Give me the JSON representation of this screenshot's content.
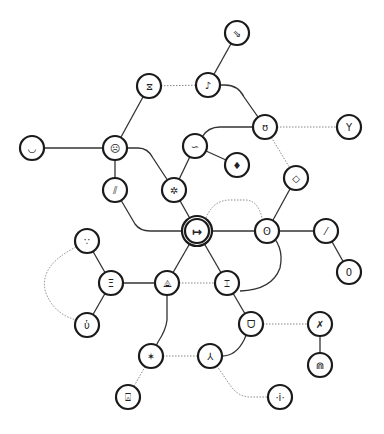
{
  "diagram": {
    "type": "node-graph",
    "background": "#ffffff",
    "node_stroke": "#1a1a1a",
    "edge_color": "#333333",
    "dotted_edge_color": "#888888",
    "node_radius": 12,
    "nodes": [
      {
        "id": "n1",
        "x": 237,
        "y": 33,
        "glyph": "⇘",
        "icon": "diagonal-arrows-icon"
      },
      {
        "id": "n2",
        "x": 208,
        "y": 85,
        "glyph": "♪",
        "icon": "curl-icon"
      },
      {
        "id": "n3",
        "x": 149,
        "y": 86,
        "glyph": "⧖",
        "icon": "hourglass-icon"
      },
      {
        "id": "n4",
        "x": 265,
        "y": 127,
        "glyph": "ʊ",
        "icon": "cup-icon"
      },
      {
        "id": "n5",
        "x": 349,
        "y": 127,
        "glyph": "Y",
        "icon": "fork-icon"
      },
      {
        "id": "n6",
        "x": 195,
        "y": 146,
        "glyph": "∽",
        "icon": "wave-icon"
      },
      {
        "id": "n7",
        "x": 237,
        "y": 165,
        "glyph": "♦",
        "icon": "gem-icon"
      },
      {
        "id": "n8",
        "x": 115,
        "y": 148,
        "glyph": "☹",
        "icon": "frown-face-icon"
      },
      {
        "id": "n9",
        "x": 32,
        "y": 148,
        "glyph": "◡",
        "icon": "smile-icon"
      },
      {
        "id": "n10",
        "x": 115,
        "y": 190,
        "glyph": "⫽",
        "icon": "double-slash-icon"
      },
      {
        "id": "n11",
        "x": 174,
        "y": 190,
        "glyph": "✲",
        "icon": "sparkle-icon"
      },
      {
        "id": "n12",
        "x": 296,
        "y": 178,
        "glyph": "◇",
        "icon": "diamond-icon"
      },
      {
        "id": "n13",
        "x": 197,
        "y": 231,
        "glyph": "↦",
        "icon": "maps-to-icon",
        "center": true
      },
      {
        "id": "n14",
        "x": 267,
        "y": 231,
        "glyph": "ʘ",
        "icon": "target-icon"
      },
      {
        "id": "n15",
        "x": 326,
        "y": 231,
        "glyph": "⁄",
        "icon": "slash-icon"
      },
      {
        "id": "n16",
        "x": 349,
        "y": 272,
        "glyph": "0",
        "icon": "capsule-icon"
      },
      {
        "id": "n17",
        "x": 87,
        "y": 241,
        "glyph": "∵",
        "icon": "dots-icon"
      },
      {
        "id": "n18",
        "x": 111,
        "y": 283,
        "glyph": "Ξ",
        "icon": "xi-icon"
      },
      {
        "id": "n19",
        "x": 167,
        "y": 283,
        "glyph": "⟁",
        "icon": "triangle-node-icon"
      },
      {
        "id": "n20",
        "x": 227,
        "y": 283,
        "glyph": "⌶",
        "icon": "beam-icon"
      },
      {
        "id": "n21",
        "x": 87,
        "y": 325,
        "glyph": "ὑ",
        "icon": "u-dot-icon"
      },
      {
        "id": "n22",
        "x": 251,
        "y": 324,
        "glyph": "ᗜ",
        "icon": "bowl-icon"
      },
      {
        "id": "n23",
        "x": 320,
        "y": 324,
        "glyph": "✗",
        "icon": "cross-icon"
      },
      {
        "id": "n24",
        "x": 151,
        "y": 356,
        "glyph": "✶",
        "icon": "star-icon"
      },
      {
        "id": "n25",
        "x": 210,
        "y": 356,
        "glyph": "⅄",
        "icon": "turned-y-icon"
      },
      {
        "id": "n26",
        "x": 320,
        "y": 365,
        "glyph": "⋒",
        "icon": "arch-icon"
      },
      {
        "id": "n27",
        "x": 128,
        "y": 397,
        "glyph": "⍓",
        "icon": "lamp-icon"
      },
      {
        "id": "n28",
        "x": 280,
        "y": 397,
        "glyph": "·i·",
        "icon": "info-dots-icon"
      }
    ],
    "edges": [
      {
        "d": "M237,33 L208,85",
        "style": "solid"
      },
      {
        "d": "M149,86 L208,85",
        "style": "dotted"
      },
      {
        "d": "M208,85 L225,85 Q238,85 244,97 L265,127",
        "style": "solid"
      },
      {
        "d": "M265,127 L349,127",
        "style": "dotted"
      },
      {
        "d": "M149,86 L115,148",
        "style": "solid"
      },
      {
        "d": "M32,148 L115,148",
        "style": "solid"
      },
      {
        "d": "M115,148 L115,190",
        "style": "solid"
      },
      {
        "d": "M115,148 L138,148 Q148,148 153,158 L174,190",
        "style": "solid"
      },
      {
        "d": "M265,127 L220,127 Q208,127 202,137 L195,146",
        "style": "solid"
      },
      {
        "d": "M195,146 L237,165",
        "style": "solid"
      },
      {
        "d": "M195,146 L174,190",
        "style": "solid"
      },
      {
        "d": "M174,190 L197,231",
        "style": "solid"
      },
      {
        "d": "M265,127 L296,178",
        "style": "dotted"
      },
      {
        "d": "M296,178 L267,231",
        "style": "solid"
      },
      {
        "d": "M115,190 L135,224 Q140,231 150,231 L197,231",
        "style": "solid"
      },
      {
        "d": "M197,231 L267,231",
        "style": "solid"
      },
      {
        "d": "M206,218 Q213,200 230,200 L245,200 Q258,200 262,218",
        "style": "dotted"
      },
      {
        "d": "M267,231 L326,231",
        "style": "solid"
      },
      {
        "d": "M326,231 L349,272",
        "style": "solid"
      },
      {
        "d": "M267,231 Q285,245 280,268 Q272,290 240,291",
        "style": "solid"
      },
      {
        "d": "M197,231 L167,283",
        "style": "solid"
      },
      {
        "d": "M197,231 L227,283",
        "style": "solid"
      },
      {
        "d": "M111,283 L167,283",
        "style": "solid"
      },
      {
        "d": "M167,283 L227,283",
        "style": "dotted"
      },
      {
        "d": "M111,283 L87,241",
        "style": "solid"
      },
      {
        "d": "M111,283 L87,325",
        "style": "solid"
      },
      {
        "d": "M76,247 Q40,265 45,290 Q52,313 76,320",
        "style": "dotted"
      },
      {
        "d": "M227,283 L251,324",
        "style": "solid"
      },
      {
        "d": "M251,324 L320,324",
        "style": "dotted"
      },
      {
        "d": "M320,324 L320,365",
        "style": "solid"
      },
      {
        "d": "M167,283 L167,320 Q166,330 158,342 L151,356",
        "style": "solid"
      },
      {
        "d": "M151,356 L210,356",
        "style": "dotted"
      },
      {
        "d": "M251,324 L244,340 Q236,356 222,356 L210,356",
        "style": "solid"
      },
      {
        "d": "M151,356 L128,397",
        "style": "dotted"
      },
      {
        "d": "M210,356 L230,385 Q238,397 250,397 L280,397",
        "style": "dotted"
      }
    ]
  }
}
